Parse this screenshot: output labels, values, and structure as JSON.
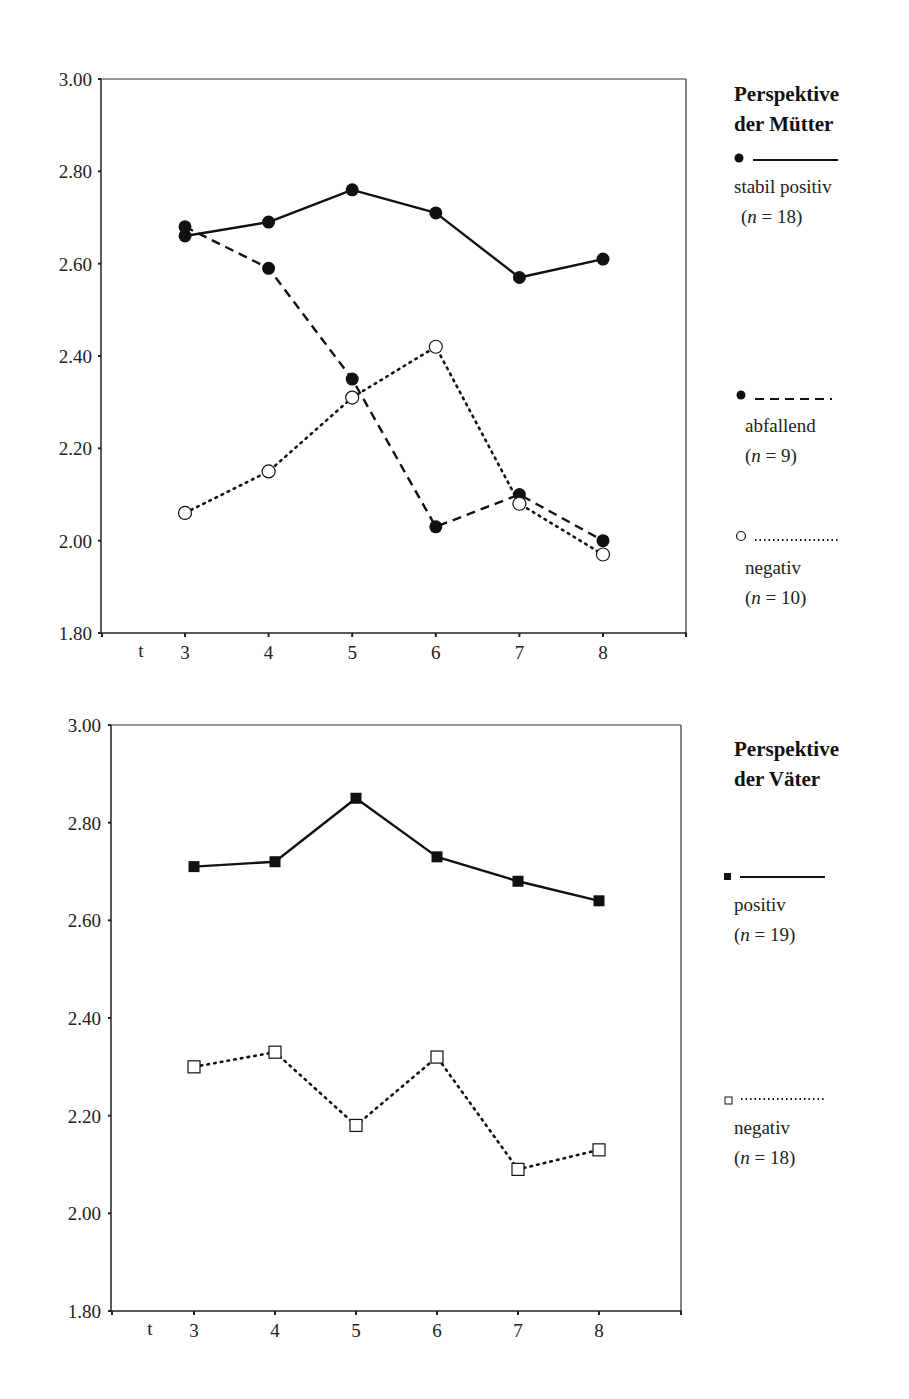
{
  "chart_data": [
    {
      "type": "line",
      "title": "Perspektive der Mütter",
      "xlabel": "t",
      "ylabel": "",
      "x": [
        3,
        4,
        5,
        6,
        7,
        8
      ],
      "ylim": [
        1.8,
        3.0
      ],
      "yticks": [
        "1.80",
        "2.00",
        "2.20",
        "2.40",
        "2.60",
        "2.80",
        "3.00"
      ],
      "xticks": [
        "3",
        "4",
        "5",
        "6",
        "7",
        "8"
      ],
      "grid": false,
      "legend_position": "right",
      "series": [
        {
          "name": "stabil positiv",
          "n_label": "(n = 18)",
          "n_value": "18",
          "marker": "filled-circle",
          "line": "solid",
          "values": [
            2.66,
            2.69,
            2.76,
            2.71,
            2.57,
            2.61
          ]
        },
        {
          "name": "abfallend",
          "n_label": "(n = 9)",
          "n_value": "9",
          "marker": "filled-circle",
          "line": "dashed",
          "values": [
            2.68,
            2.59,
            2.35,
            2.03,
            2.1,
            2.0
          ]
        },
        {
          "name": "negativ",
          "n_label": "(n = 10)",
          "n_value": "10",
          "marker": "open-circle",
          "line": "dotted",
          "values": [
            2.06,
            2.15,
            2.31,
            2.42,
            2.08,
            1.97
          ]
        }
      ]
    },
    {
      "type": "line",
      "title": "Perspektive der Väter",
      "xlabel": "t",
      "ylabel": "",
      "x": [
        3,
        4,
        5,
        6,
        7,
        8
      ],
      "ylim": [
        1.8,
        3.0
      ],
      "yticks": [
        "1.80",
        "2.00",
        "2.20",
        "2.40",
        "2.60",
        "2.80",
        "3.00"
      ],
      "xticks": [
        "3",
        "4",
        "5",
        "6",
        "7",
        "8"
      ],
      "grid": false,
      "legend_position": "right",
      "series": [
        {
          "name": "positiv",
          "n_label": "(n = 19)",
          "n_value": "19",
          "marker": "filled-square",
          "line": "solid",
          "values": [
            2.71,
            2.72,
            2.85,
            2.73,
            2.68,
            2.64
          ]
        },
        {
          "name": "negativ",
          "n_label": "(n = 18)",
          "n_value": "18",
          "marker": "open-square",
          "line": "dotted",
          "values": [
            2.3,
            2.33,
            2.18,
            2.32,
            2.09,
            2.13
          ]
        }
      ]
    }
  ],
  "legends": {
    "mothers": {
      "title_line1": "Perspektive",
      "title_line2": "der Mütter",
      "items": [
        {
          "label": "stabil positiv",
          "n": "18"
        },
        {
          "label": "abfallend",
          "n": "9"
        },
        {
          "label": "negativ",
          "n": "10"
        }
      ]
    },
    "fathers": {
      "title_line1": "Perspektive",
      "title_line2": "der Väter",
      "items": [
        {
          "label": "positiv",
          "n": "19"
        },
        {
          "label": "negativ",
          "n": "18"
        }
      ]
    }
  },
  "colors": {
    "ink": "#111111",
    "background": "#ffffff"
  }
}
